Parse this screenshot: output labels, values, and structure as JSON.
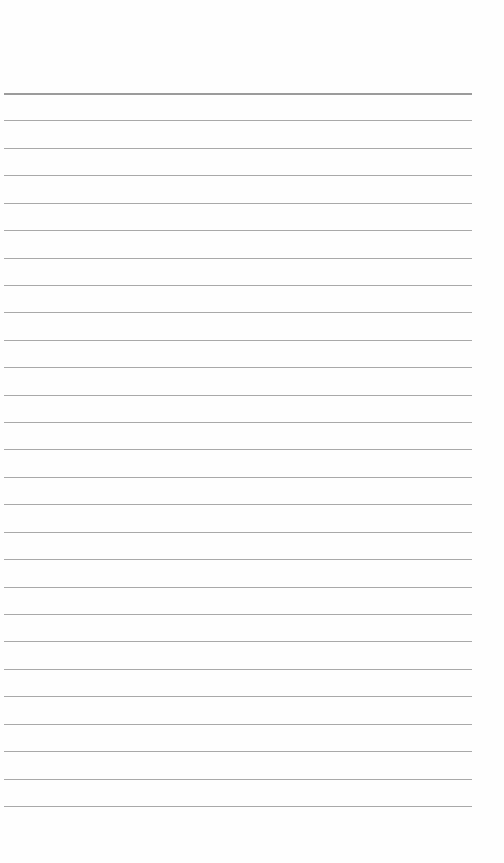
{
  "page": {
    "type": "lined-paper",
    "background": "#ffffff",
    "rule_color": "#9a9a9a",
    "header_rule_color": "#8a8a8a"
  },
  "rules": {
    "first_y": 93,
    "spacing": 27.42,
    "count": 27,
    "left": 4,
    "width": 468
  }
}
